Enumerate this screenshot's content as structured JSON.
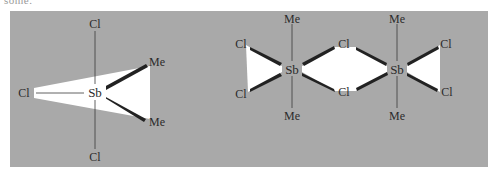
{
  "page": {
    "top_fragment": "some.",
    "panel_color": "#a9a9a9",
    "wedge_fill": "#ffffff",
    "bond_color": "#2b2b2b"
  },
  "monomer": {
    "center": {
      "label": "Sb",
      "x": 95,
      "y": 92
    },
    "axial_top": {
      "label": "Cl",
      "x": 95,
      "y": 24
    },
    "axial_bottom": {
      "label": "Cl",
      "x": 95,
      "y": 157
    },
    "equatorial_left": {
      "label": "Cl",
      "x": 24,
      "y": 93
    },
    "equatorial_upper": {
      "label": "Me",
      "x": 150,
      "y": 62
    },
    "equatorial_lower": {
      "label": "Me",
      "x": 150,
      "y": 122
    }
  },
  "dimer": {
    "sb1": {
      "label": "Sb",
      "x": 292,
      "y": 69
    },
    "sb2": {
      "label": "Sb",
      "x": 397,
      "y": 69
    },
    "me1_top": {
      "label": "Me",
      "x": 292,
      "y": 19
    },
    "me1_bottom": {
      "label": "Me",
      "x": 292,
      "y": 116
    },
    "me2_top": {
      "label": "Me",
      "x": 397,
      "y": 19
    },
    "me2_bottom": {
      "label": "Me",
      "x": 397,
      "y": 116
    },
    "cl_left_top": {
      "label": "Cl",
      "x": 241,
      "y": 44
    },
    "cl_left_bottom": {
      "label": "Cl",
      "x": 241,
      "y": 94
    },
    "cl_bridge_top": {
      "label": "Cl",
      "x": 344,
      "y": 44
    },
    "cl_bridge_bottom": {
      "label": "Cl",
      "x": 344,
      "y": 92
    },
    "cl_right_top": {
      "label": "Cl",
      "x": 445,
      "y": 44
    },
    "cl_right_bottom": {
      "label": "Cl",
      "x": 446,
      "y": 92
    }
  }
}
